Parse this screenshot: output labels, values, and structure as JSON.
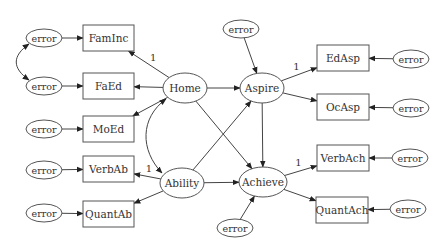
{
  "diagram": {
    "type": "structural-equation-model",
    "latent": [
      {
        "id": "home",
        "label": "Home"
      },
      {
        "id": "aspire",
        "label": "Aspire"
      },
      {
        "id": "ability",
        "label": "Ability"
      },
      {
        "id": "achieve",
        "label": "Achieve"
      }
    ],
    "observed": [
      {
        "id": "faminc",
        "label": "FamInc"
      },
      {
        "id": "faed",
        "label": "FaEd"
      },
      {
        "id": "moed",
        "label": "MoEd"
      },
      {
        "id": "verbab",
        "label": "VerbAb"
      },
      {
        "id": "quantab",
        "label": "QuantAb"
      },
      {
        "id": "edasp",
        "label": "EdAsp"
      },
      {
        "id": "ocasp",
        "label": "OcAsp"
      },
      {
        "id": "verbach",
        "label": "VerbAch"
      },
      {
        "id": "quantach",
        "label": "QuantAch"
      }
    ],
    "error_label": "error",
    "errors": [
      {
        "id": "e-faminc",
        "target": "faminc"
      },
      {
        "id": "e-faed",
        "target": "faed"
      },
      {
        "id": "e-moed",
        "target": "moed"
      },
      {
        "id": "e-verbab",
        "target": "verbab"
      },
      {
        "id": "e-quantab",
        "target": "quantab"
      },
      {
        "id": "e-edasp",
        "target": "edasp"
      },
      {
        "id": "e-ocasp",
        "target": "ocasp"
      },
      {
        "id": "e-verbach",
        "target": "verbach"
      },
      {
        "id": "e-quantach",
        "target": "quantach"
      },
      {
        "id": "e-aspire",
        "target": "aspire"
      },
      {
        "id": "e-achieve",
        "target": "achieve"
      }
    ],
    "paths": [
      {
        "from": "home",
        "to": "faminc",
        "label": "1"
      },
      {
        "from": "home",
        "to": "faed",
        "label": ""
      },
      {
        "from": "home",
        "to": "moed",
        "label": ""
      },
      {
        "from": "ability",
        "to": "verbab",
        "label": "1"
      },
      {
        "from": "ability",
        "to": "quantab",
        "label": ""
      },
      {
        "from": "aspire",
        "to": "edasp",
        "label": "1"
      },
      {
        "from": "aspire",
        "to": "ocasp",
        "label": ""
      },
      {
        "from": "achieve",
        "to": "verbach",
        "label": "1"
      },
      {
        "from": "achieve",
        "to": "quantach",
        "label": ""
      },
      {
        "from": "home",
        "to": "aspire",
        "label": ""
      },
      {
        "from": "home",
        "to": "achieve",
        "label": ""
      },
      {
        "from": "ability",
        "to": "aspire",
        "label": ""
      },
      {
        "from": "ability",
        "to": "achieve",
        "label": ""
      },
      {
        "from": "aspire",
        "to": "achieve",
        "label": ""
      }
    ],
    "covariances": [
      {
        "a": "home",
        "b": "ability"
      },
      {
        "a": "e-faminc",
        "b": "e-faed"
      }
    ],
    "fixed_loading_label": "1"
  }
}
